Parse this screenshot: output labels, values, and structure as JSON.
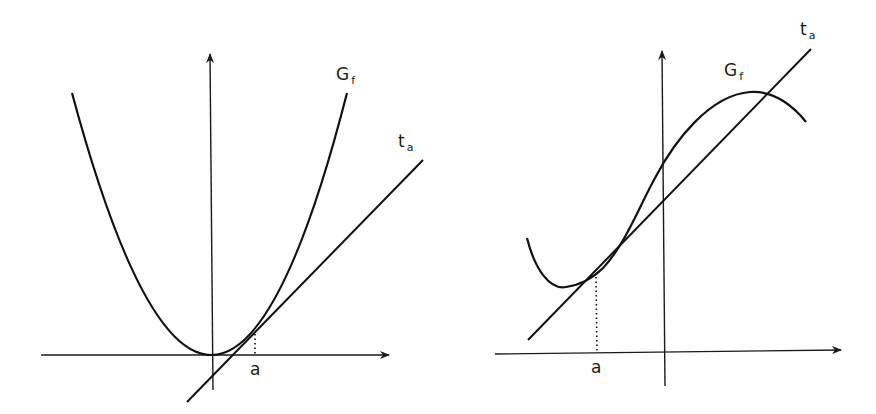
{
  "figure": {
    "width": 876,
    "height": 414,
    "colors": {
      "ink": "#111111",
      "background": "#ffffff"
    }
  },
  "left_panel": {
    "graph_label": {
      "main": "G",
      "sub": "f"
    },
    "tangent_label": {
      "main": "t",
      "sub": "a"
    },
    "point_label": "a",
    "description": "Convex function (parabola) with tangent line at x=a lying below the graph"
  },
  "right_panel": {
    "graph_label": {
      "main": "G",
      "sub": "f"
    },
    "tangent_label": {
      "main": "t",
      "sub": "a"
    },
    "point_label": "a",
    "description": "Cubic-like function with tangent at x=a that crosses the graph again"
  }
}
